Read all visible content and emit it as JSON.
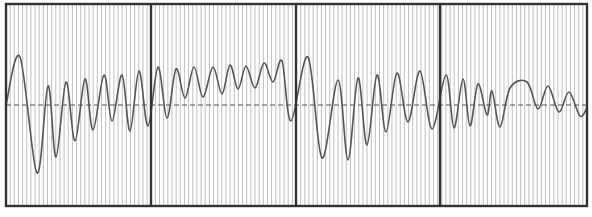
{
  "chart_data": {
    "type": "line",
    "title": "",
    "xlabel": "",
    "ylabel": "",
    "grid": true,
    "legend": null,
    "panels": 4,
    "baseline_y_px": 105,
    "frame_px": {
      "left": 6,
      "top": 4,
      "right": 587,
      "bottom": 206
    },
    "divider_x_px": [
      151,
      296,
      440
    ],
    "grid_spacing_px": 4.15,
    "colors": {
      "background": "#ffffff",
      "grid": "#b8b8b8",
      "frame": "#333333",
      "trace": "#555555",
      "baseline": "#555555"
    },
    "series": [
      {
        "name": "waveform",
        "points_px": [
          [
            6,
            105
          ],
          [
            20,
            57
          ],
          [
            37,
            173
          ],
          [
            48,
            86
          ],
          [
            56,
            157
          ],
          [
            66,
            82
          ],
          [
            75,
            141
          ],
          [
            85,
            79
          ],
          [
            93,
            130
          ],
          [
            104,
            75
          ],
          [
            112,
            121
          ],
          [
            122,
            75
          ],
          [
            130,
            131
          ],
          [
            139,
            71
          ],
          [
            148,
            126
          ],
          [
            158,
            67
          ],
          [
            167,
            118
          ],
          [
            176,
            69
          ],
          [
            185,
            98
          ],
          [
            194,
            67
          ],
          [
            203,
            97
          ],
          [
            213,
            67
          ],
          [
            222,
            94
          ],
          [
            230,
            65
          ],
          [
            238,
            89
          ],
          [
            246,
            66
          ],
          [
            255,
            88
          ],
          [
            264,
            63
          ],
          [
            273,
            82
          ],
          [
            282,
            61
          ],
          [
            291,
            121
          ],
          [
            308,
            57
          ],
          [
            322,
            158
          ],
          [
            338,
            80
          ],
          [
            348,
            160
          ],
          [
            358,
            78
          ],
          [
            367,
            145
          ],
          [
            377,
            75
          ],
          [
            386,
            132
          ],
          [
            397,
            73
          ],
          [
            408,
            122
          ],
          [
            420,
            71
          ],
          [
            432,
            129
          ],
          [
            446,
            75
          ],
          [
            454,
            128
          ],
          [
            463,
            79
          ],
          [
            470,
            126
          ],
          [
            478,
            84
          ],
          [
            487,
            115
          ],
          [
            492,
            91
          ],
          [
            500,
            127
          ],
          [
            510,
            88
          ],
          [
            527,
            82
          ],
          [
            538,
            109
          ],
          [
            548,
            86
          ],
          [
            559,
            112
          ],
          [
            569,
            92
          ],
          [
            580,
            116
          ],
          [
            587,
            108
          ]
        ]
      }
    ]
  }
}
